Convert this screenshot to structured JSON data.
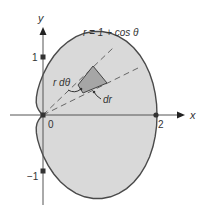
{
  "figure": {
    "equation": "r = 1 + cos θ",
    "axes": {
      "x_label": "x",
      "y_label": "y",
      "origin_label": "0",
      "x_tick_label": "2",
      "y_tick_top_label": "1",
      "y_tick_bottom_label": "−1"
    },
    "annotations": {
      "arc_element": "r dθ",
      "radial_element": "dr"
    },
    "colors": {
      "fill": "#d9d9d9",
      "curve": "#4a4a4a",
      "element": "#a6a6a6",
      "axis": "#555555",
      "dash": "#666666"
    }
  }
}
